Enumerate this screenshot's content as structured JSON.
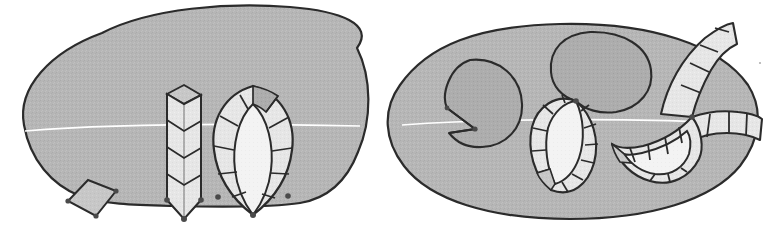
{
  "figure": {
    "title": "",
    "caption": "",
    "background_color": "#ffffff",
    "stroke_color": "#2b2b2b",
    "palette": {
      "blob_fill": "#b4b4b4",
      "cell_light": "#e8e8e8",
      "cell_white": "#f2f2f2",
      "cell_mid": "#c9c9c9",
      "cell_dark": "#a0a0a0",
      "inner_lens_fill": "#f4f4f4",
      "vertex_dot": "#4a4a4a",
      "section_line": "#ffffff"
    },
    "stroke_width_outline": "2.2",
    "stroke_width_cell": "1.8"
  },
  "panels": [
    {
      "id": "panel-left",
      "label": "",
      "region_name": "left-blob-region",
      "shape": "rounded-blob",
      "elements": [
        {
          "name": "small-quadrilateral",
          "type": "quad",
          "fill": "cell_mid",
          "vertices": 4
        },
        {
          "name": "segmented-column",
          "type": "column",
          "fill": "cell_light",
          "segments": 4,
          "has_top_face": true
        },
        {
          "name": "segmented-lens-leaf",
          "type": "lens",
          "fill": "cell_light",
          "segments_per_side": 5,
          "has_inner_lens": true
        }
      ]
    },
    {
      "id": "panel-right",
      "label": "",
      "region_name": "right-ellipse-region",
      "shape": "ellipse",
      "elements": [
        {
          "name": "notched-circle",
          "type": "blob",
          "fill": "blob_fill",
          "has_notch": true
        },
        {
          "name": "plain-blob",
          "type": "blob",
          "fill": "blob_fill",
          "has_notch": false
        },
        {
          "name": "segmented-lens-tilted",
          "type": "lens",
          "fill": "cell_light",
          "segments_per_side": 7,
          "has_inner_lens": true
        },
        {
          "name": "segmented-trifurcation",
          "type": "band-junction",
          "fill": "cell_light",
          "branches": 3,
          "has_inner_lens": true
        }
      ]
    }
  ],
  "annotations": {
    "section_line_count": 2,
    "vertex_dot_count": 9,
    "speck_artifact": true
  }
}
